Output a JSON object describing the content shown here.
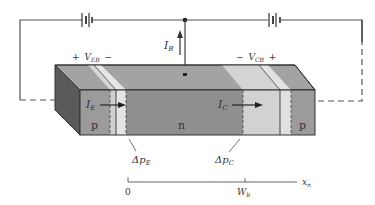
{
  "diagram": {
    "colors": {
      "wire": "#555555",
      "region_dark": "#8f8f8f",
      "region_top": "#a3a3a3",
      "side_face": "#5a5a5a",
      "depletion_light": "#d4d4d4",
      "depletion_lighter": "#e6e6e6",
      "text": "#333333"
    },
    "labels": {
      "ib_main": "I",
      "ib_sub": "B",
      "veb_plus": "+",
      "veb_main": "V",
      "veb_sub": "EB",
      "veb_minus": "−",
      "vcb_minus": "−",
      "vcb_main": "V",
      "vcb_sub": "CB",
      "vcb_plus": "+",
      "ie_main": "I",
      "ie_sub": "E",
      "ic_main": "I",
      "ic_sub": "C",
      "emitter_region": "p",
      "base_region": "n",
      "collector_region": "p",
      "dpe_main": "Δp",
      "dpe_sub": "E",
      "dpc_main": "Δp",
      "dpc_sub": "C",
      "axis_origin": "0",
      "axis_wb_main": "W",
      "axis_wb_sub": "b",
      "axis_var_main": "x",
      "axis_var_sub": "n"
    }
  }
}
